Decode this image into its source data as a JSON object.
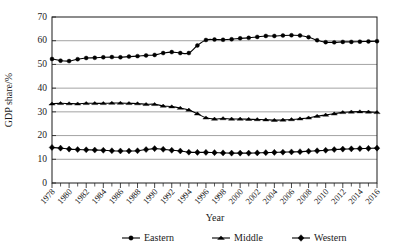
{
  "chart_data": {
    "type": "line",
    "title": "",
    "xlabel": "Year",
    "ylabel": "GDP share/%",
    "ylim": [
      0,
      70
    ],
    "ytick_step": 10,
    "yticks": [
      "0",
      "10",
      "20",
      "30",
      "40",
      "50",
      "60",
      "70"
    ],
    "grid": "horizontal",
    "legend_position": "bottom",
    "x": [
      1978,
      1979,
      1980,
      1981,
      1982,
      1983,
      1984,
      1985,
      1986,
      1987,
      1988,
      1989,
      1990,
      1991,
      1992,
      1993,
      1994,
      1995,
      1996,
      1997,
      1998,
      1999,
      2000,
      2001,
      2002,
      2003,
      2004,
      2005,
      2006,
      2007,
      2008,
      2009,
      2010,
      2011,
      2012,
      2013,
      2014,
      2015,
      2016
    ],
    "xtick_labels": [
      "1978",
      "1980",
      "1982",
      "1984",
      "1986",
      "1988",
      "1990",
      "1992",
      "1994",
      "1996",
      "1998",
      "2000",
      "2002",
      "2004",
      "2006",
      "2008",
      "2010",
      "2012",
      "2014",
      "2016"
    ],
    "xtick_years": [
      1978,
      1980,
      1982,
      1984,
      1986,
      1988,
      1990,
      1992,
      1994,
      1996,
      1998,
      2000,
      2002,
      2004,
      2006,
      2008,
      2010,
      2012,
      2014,
      2016
    ],
    "series": [
      {
        "name": "Eastern",
        "marker": "circle",
        "color": "#000000",
        "values": [
          52.3,
          51.6,
          51.4,
          52.2,
          52.7,
          52.8,
          53.0,
          53.1,
          53.0,
          53.3,
          53.5,
          53.8,
          54.0,
          54.8,
          55.2,
          54.8,
          54.8,
          58.0,
          60.3,
          60.5,
          60.4,
          60.6,
          61.0,
          61.2,
          61.6,
          62.0,
          62.0,
          62.2,
          62.3,
          62.2,
          61.5,
          60.2,
          59.4,
          59.3,
          59.5,
          59.5,
          59.6,
          59.7,
          59.8
        ]
      },
      {
        "name": "Middle",
        "marker": "triangle",
        "color": "#000000",
        "values": [
          33.4,
          33.6,
          33.5,
          33.4,
          33.6,
          33.6,
          33.6,
          33.7,
          33.7,
          33.6,
          33.5,
          33.2,
          33.2,
          32.5,
          32.2,
          31.6,
          30.8,
          29.2,
          27.5,
          27.0,
          27.2,
          27.0,
          27.0,
          26.9,
          26.8,
          26.7,
          26.5,
          26.6,
          26.8,
          27.1,
          27.5,
          28.2,
          28.7,
          29.2,
          29.8,
          30.0,
          30.1,
          30.0,
          29.8
        ]
      },
      {
        "name": "Western",
        "marker": "diamond",
        "color": "#000000",
        "values": [
          15.0,
          14.7,
          14.3,
          14.1,
          14.0,
          13.9,
          13.8,
          13.6,
          13.5,
          13.5,
          13.6,
          14.1,
          14.5,
          14.2,
          13.8,
          13.5,
          13.0,
          12.9,
          12.9,
          12.8,
          12.7,
          12.6,
          12.6,
          12.6,
          12.7,
          12.8,
          12.9,
          13.0,
          13.1,
          13.2,
          13.4,
          13.6,
          13.8,
          14.1,
          14.3,
          14.4,
          14.5,
          14.6,
          14.7
        ]
      }
    ]
  },
  "legend": {
    "items": [
      {
        "label": "Eastern",
        "marker": "circle"
      },
      {
        "label": "Middle",
        "marker": "triangle"
      },
      {
        "label": "Western",
        "marker": "diamond"
      }
    ]
  }
}
